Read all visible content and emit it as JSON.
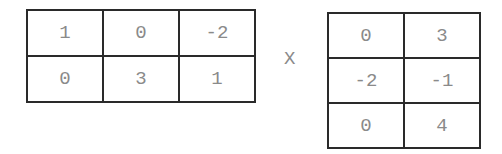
{
  "matrix_a": {
    "rows": [
      [
        "1",
        "0",
        "-2"
      ],
      [
        "0",
        "3",
        "1"
      ]
    ]
  },
  "operator": "X",
  "matrix_b": {
    "rows": [
      [
        "0",
        "3"
      ],
      [
        "-2",
        "-1"
      ],
      [
        "0",
        "4"
      ]
    ]
  }
}
